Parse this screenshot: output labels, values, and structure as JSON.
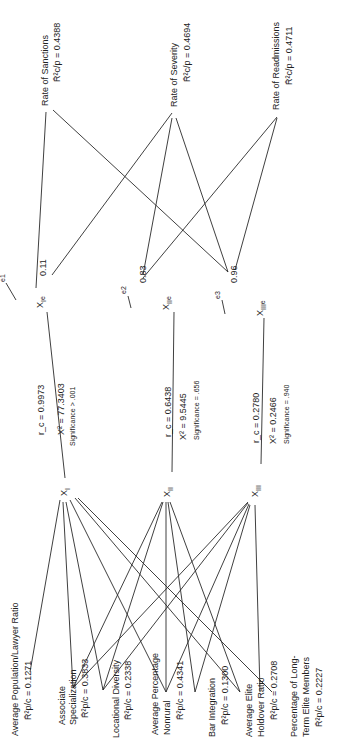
{
  "predictors": [
    {
      "label": "Average Population/Lawyer Ratio",
      "stat": "R̄²p/c = 0.1271"
    },
    {
      "label1": "Associate",
      "label2": "Specialization",
      "stat": "R̄²p/c = 0.3833"
    },
    {
      "label": "Locational Diversity",
      "stat": "R̄²p/c = 0.2338"
    },
    {
      "label1": "Average Percentage",
      "label2": "Nonrural",
      "stat": "R̄²p/c = 0.4341"
    },
    {
      "label": "Bar Integration",
      "stat": "R̄²p/c = 0.1300"
    },
    {
      "label1": "Average Elite",
      "label2": "Holdover Ratio",
      "stat": "R̄²p/c = 0.2708"
    },
    {
      "label1": "Percentage of Long-",
      "label2": "Term Elite Members",
      "stat": "R̄²p/c = 0.2227"
    }
  ],
  "canonical": [
    {
      "node": "X",
      "sub": "I",
      "rc": "r_c = 0.9973",
      "chi": "X² = 77.3403",
      "sig": "Significance > .001",
      "enode": "X",
      "esub": "I",
      "e": "e1",
      "evalue": "0.11"
    },
    {
      "node": "X",
      "sub": "II",
      "rc": "r_c = 0.6438",
      "chi": "X² = 9.5445",
      "sig": "Significance = .656",
      "enode": "X",
      "esub": "II",
      "e": "e2",
      "evalue": "0.83"
    },
    {
      "node": "X",
      "sub": "III",
      "rc": "r_c = 0.2780",
      "chi": "X² = 0.2466",
      "sig": "Significance = .940",
      "enode": "X",
      "esub": "III",
      "e": "e3",
      "evalue": "0.96"
    }
  ],
  "outcomes": [
    {
      "label": "Rate of Sanctions",
      "stat": "R̄²c/p = 0.4388"
    },
    {
      "label": "Rate of Severity",
      "stat": "R̄²c/p = 0.4694"
    },
    {
      "label": "Rate of Readmissions",
      "stat": "R̄²c/p = 0.4711"
    }
  ]
}
